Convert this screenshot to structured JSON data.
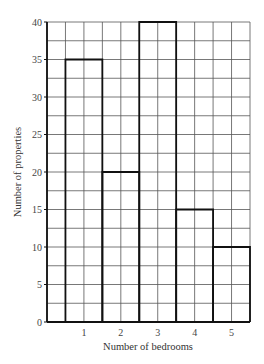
{
  "chart_data": {
    "type": "bar",
    "title": "",
    "xlabel": "Number of bedrooms",
    "ylabel": "Number of properties",
    "categories": [
      "1",
      "2",
      "3",
      "4",
      "5"
    ],
    "values": [
      35,
      20,
      40,
      15,
      10
    ],
    "ylim": [
      0,
      40
    ],
    "yticks": [
      0,
      5,
      10,
      15,
      20,
      25,
      30,
      35,
      40
    ],
    "grid": true,
    "legend": null,
    "bar_style": "outline, adjacent (histogram style)"
  },
  "colors": {
    "grid": "#555555",
    "bar_outline": "#111111",
    "axis": "#111111",
    "text": "#333333"
  }
}
